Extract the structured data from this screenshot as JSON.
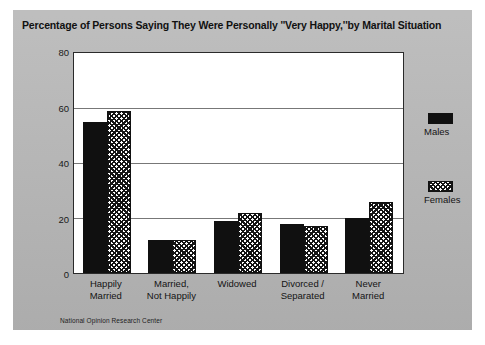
{
  "chart_data": {
    "type": "bar",
    "title": "Percentage of Persons Saying They Were Personally ''Very Happy,''by Marital Situation",
    "xlabel": "",
    "ylabel": "",
    "ylim": [
      0,
      80
    ],
    "yticks": [
      0,
      20,
      40,
      60,
      80
    ],
    "grid": true,
    "legend_position": "right",
    "categories": [
      "Happily Married",
      "Married, Not Happily",
      "Widowed",
      "Divorced / Separated",
      "Never Married"
    ],
    "category_lines": [
      [
        "Happily",
        "Married"
      ],
      [
        "Married,",
        "Not Happily"
      ],
      [
        "Widowed",
        ""
      ],
      [
        "Divorced /",
        "Separated"
      ],
      [
        "Never",
        "Married"
      ]
    ],
    "series": [
      {
        "name": "Males",
        "values": [
          55,
          12,
          19,
          18,
          20
        ],
        "color": "#101010",
        "fill": "solid"
      },
      {
        "name": "Females",
        "values": [
          59,
          12,
          22,
          17,
          26
        ],
        "color": "#ffffff",
        "fill": "hatched"
      }
    ],
    "source_note": "National Opinion Research Center"
  },
  "legend": {
    "items": [
      {
        "label": "Males"
      },
      {
        "label": "Females"
      }
    ]
  }
}
